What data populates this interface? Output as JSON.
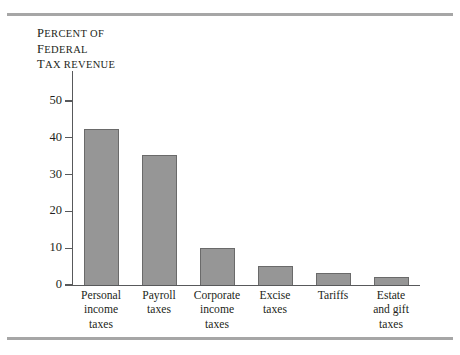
{
  "figure": {
    "axis_title_lines": [
      "Percent of",
      "Federal",
      "tax revenue"
    ],
    "rules": {
      "top": true,
      "bottom": true
    }
  },
  "chart_data": {
    "type": "bar",
    "title": "",
    "xlabel": "",
    "ylabel": "PERCENT OF FEDERAL TAX REVENUE",
    "categories": [
      "Personal income taxes",
      "Payroll taxes",
      "Corporate income taxes",
      "Excise taxes",
      "Tariffs",
      "Estate and gift taxes"
    ],
    "category_lines": [
      [
        "Personal",
        "income",
        "taxes"
      ],
      [
        "Payroll",
        "taxes"
      ],
      [
        "Corporate",
        "income",
        "taxes"
      ],
      [
        "Excise",
        "taxes"
      ],
      [
        "Tariffs"
      ],
      [
        "Estate",
        "and gift",
        "taxes"
      ]
    ],
    "values": [
      42.3,
      35.3,
      10.0,
      5.1,
      3.3,
      2.3
    ],
    "ylim": [
      0,
      50
    ],
    "yticks": [
      0,
      10,
      20,
      30,
      40,
      50
    ],
    "ytick_labels": [
      "0",
      "10",
      "20",
      "30",
      "40",
      "50"
    ],
    "grid": false,
    "legend": null,
    "bar_color": "#969696",
    "bar_edge_color": "#6a6a6a",
    "axis_color": "#58595b"
  }
}
